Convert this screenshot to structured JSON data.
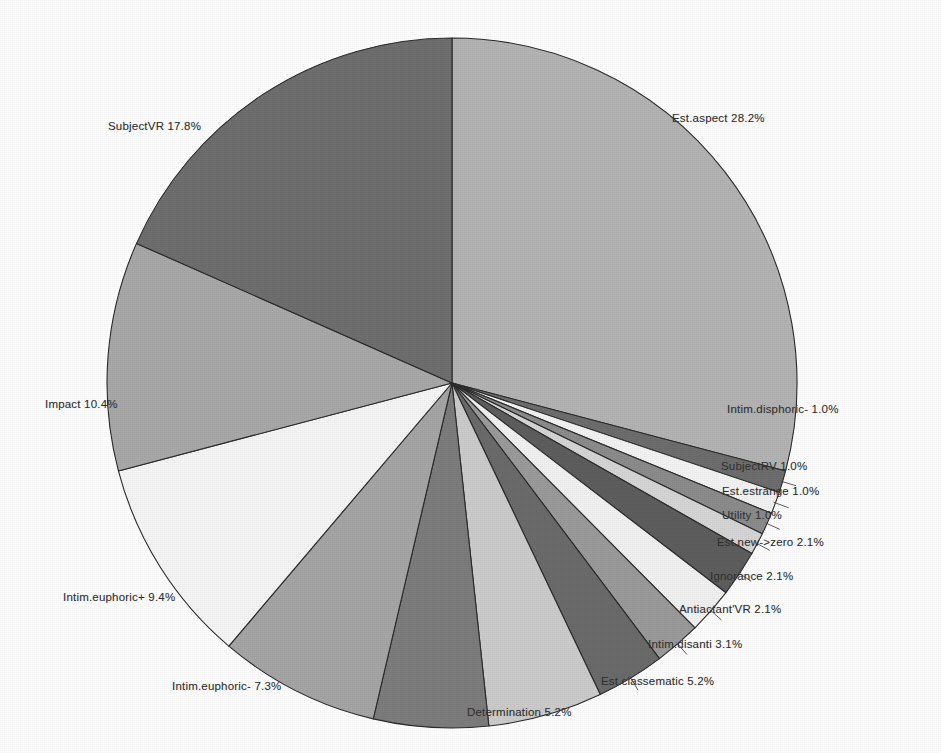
{
  "chart_data": {
    "type": "pie",
    "title": "",
    "subtitle": "",
    "xlabel": "",
    "ylabel": "",
    "legend_position": "none",
    "grid": false,
    "label_format": "name percent",
    "start_angle_deg": 0,
    "direction": "clockwise",
    "categories": [
      "Est.aspect",
      "Intim.disphoric-",
      "SubjectRV",
      "Est.estrange",
      "Utility",
      "Est.new->zero",
      "Ignorance",
      "Antiactant'VR",
      "Intim.disanti",
      "Est.classematic",
      "Determination",
      "Intim.euphoric-",
      "Intim.euphoric+",
      "Impact",
      "SubjectVR"
    ],
    "values": [
      28.2,
      1.0,
      1.0,
      1.0,
      1.0,
      2.1,
      2.1,
      2.1,
      3.1,
      5.2,
      5.2,
      7.3,
      9.4,
      10.4,
      17.8
    ],
    "colors": [
      "#b0b0b0",
      "#8e8e8e",
      "#6e6e6e",
      "#f2f2f2",
      "#cfcfcf",
      "#5c5c5c",
      "#9d9d9d",
      "#e6e6e6",
      "#757575",
      "#bdbdbd",
      "#6a6a6a",
      "#dcdcdc",
      "#9a9a9a",
      "#f7f7f7",
      "#a8a8a8",
      "#b8b8b8",
      "#707070"
    ],
    "slices": [
      {
        "label": "Est.aspect",
        "value": 28.2,
        "text": "Est.aspect  28.2%",
        "color": "#b4b4b4"
      },
      {
        "label": "Intim.disphoric-",
        "value": 1.0,
        "text": "Intim.disphoric-  1.0%",
        "color": "#6e6e6e"
      },
      {
        "label": "SubjectRV",
        "value": 1.0,
        "text": "SubjectRV  1.0%",
        "color": "#f4f4f4"
      },
      {
        "label": "Est.estrange",
        "value": 1.0,
        "text": "Est.estrange  1.0%",
        "color": "#8c8c8c"
      },
      {
        "label": "Utility",
        "value": 1.0,
        "text": "Utility  1.0%",
        "color": "#d6d6d6"
      },
      {
        "label": "Est.new->zero",
        "value": 2.1,
        "text": "Est.new->zero  2.1%",
        "color": "#5e5e5e"
      },
      {
        "label": "Ignorance",
        "value": 2.1,
        "text": "Ignorance  2.1%",
        "color": "#f2f2f2"
      },
      {
        "label": "Antiactant'VR",
        "value": 2.1,
        "text": "Antiactant'VR  2.1%",
        "color": "#9b9b9b"
      },
      {
        "label": "Intim.disanti",
        "value": 3.1,
        "text": "Intim.disanti  3.1%",
        "color": "#6b6b6b"
      },
      {
        "label": "Est.classematic",
        "value": 5.2,
        "text": "Est.classematic  5.2%",
        "color": "#cccccc"
      },
      {
        "label": "Determination",
        "value": 5.2,
        "text": "Determination  5.2%",
        "color": "#7d7d7d"
      },
      {
        "label": "Intim.euphoric-",
        "value": 7.3,
        "text": "Intim.euphoric-  7.3%",
        "color": "#a6a6a6"
      },
      {
        "label": "Intim.euphoric+",
        "value": 9.4,
        "text": "Intim.euphoric+  9.4%",
        "color": "#f6f6f6"
      },
      {
        "label": "Impact",
        "value": 10.4,
        "text": "Impact  10.4%",
        "color": "#a9a9a9"
      },
      {
        "label": "SubjectVR",
        "value": 17.8,
        "text": "SubjectVR  17.8%",
        "color": "#6f6f6f"
      }
    ]
  },
  "labels": {
    "est_aspect": "Est.aspect  28.2%",
    "subject_vr": "SubjectVR  17.8%",
    "impact": "Impact  10.4%",
    "intim_euphoric_plus": "Intim.euphoric+  9.4%",
    "intim_euphoric_minus": "Intim.euphoric-  7.3%",
    "determination": "Determination  5.2%",
    "est_classematic": "Est.classematic  5.2%",
    "intim_disanti": "Intim.disanti  3.1%",
    "antiactant_vr": "Antiactant'VR  2.1%",
    "ignorance": "Ignorance  2.1%",
    "est_new_zero": "Est.new->zero  2.1%",
    "utility": "Utility  1.0%",
    "est_estrange": "Est.estrange  1.0%",
    "subject_rv": "SubjectRV  1.0%",
    "intim_disphoric_minus": "Intim.disphoric-  1.0%"
  }
}
